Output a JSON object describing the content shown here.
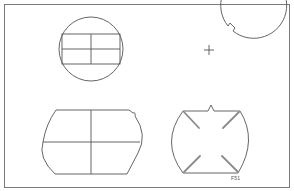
{
  "figure": {
    "label": "F51",
    "colors": {
      "frame": "#7a7a7a",
      "stroke": "#555555",
      "marker": "#8a8a8a",
      "background": "#ffffff"
    },
    "panels": [
      {
        "id": "top-left",
        "description": "circle with inscribed rectangle divided into four cells"
      },
      {
        "id": "top-right",
        "description": "circle with center crosshair and small notch at upper right"
      },
      {
        "id": "bottom-left",
        "description": "barrel shape with flat top and bottom, quartered by cross lines, small notch at upper right"
      },
      {
        "id": "bottom-right",
        "description": "barrel shape with top center notch and four diagonal corner marks"
      }
    ]
  }
}
